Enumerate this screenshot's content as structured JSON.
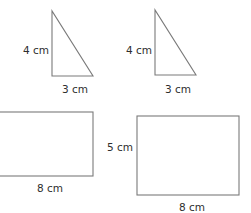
{
  "figures": {
    "triangle_a": {
      "kind": "right-triangle",
      "height_label": "4 cm",
      "base_label": "3 cm"
    },
    "triangle_b": {
      "kind": "right-triangle",
      "height_label": "4 cm",
      "base_label": "3 cm"
    },
    "rectangle_a": {
      "kind": "rectangle",
      "width_label": "8 cm"
    },
    "rectangle_b": {
      "kind": "rectangle",
      "height_label": "5 cm",
      "width_label": "8 cm"
    }
  },
  "colors": {
    "stroke": "#7a7a7a",
    "text": "#2e2e2e",
    "background": "#ffffff"
  }
}
